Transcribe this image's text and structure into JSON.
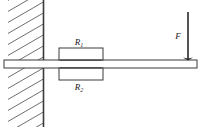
{
  "figure": {
    "type": "mechanics-free-body-diagram",
    "canvas": {
      "width": 205,
      "height": 127,
      "background": "#ffffff"
    },
    "stroke_color": "#3a3a3a",
    "hatch_color": "#6e6e6e",
    "label_color": "#1a1a1a"
  },
  "wall": {
    "name": "fixed support wall",
    "edge_line": {
      "x": 43.5,
      "y_top": 0,
      "y_bottom": 127
    },
    "hatch_region": {
      "x": 8,
      "y": 0,
      "width": 35.5,
      "height": 127
    },
    "hatch_angle_deg": -30,
    "hatch_spacing": 11,
    "hatch_count": 12
  },
  "beam": {
    "name": "horizontal beam",
    "x": 4,
    "y": 60,
    "width": 193,
    "height": 8,
    "left_end": 4,
    "right_end": 197
  },
  "elements": [
    {
      "id": "r1",
      "label": "R",
      "subscript": "1",
      "position": "above-beam",
      "box": {
        "x": 59,
        "y": 48,
        "width": 44,
        "height": 12
      },
      "label_x": 79,
      "label_y": 44
    },
    {
      "id": "r2",
      "label": "R",
      "subscript": "2",
      "position": "below-beam",
      "box": {
        "x": 59,
        "y": 68,
        "width": 44,
        "height": 12
      },
      "label_x": 79,
      "label_y": 89
    }
  ],
  "force": {
    "name": "applied force",
    "label": "F",
    "direction": "down",
    "arrow": {
      "x": 188,
      "y_start": 12,
      "y_end": 60
    },
    "head_width": 5,
    "head_length": 9,
    "label_x": 178,
    "label_y": 36
  }
}
